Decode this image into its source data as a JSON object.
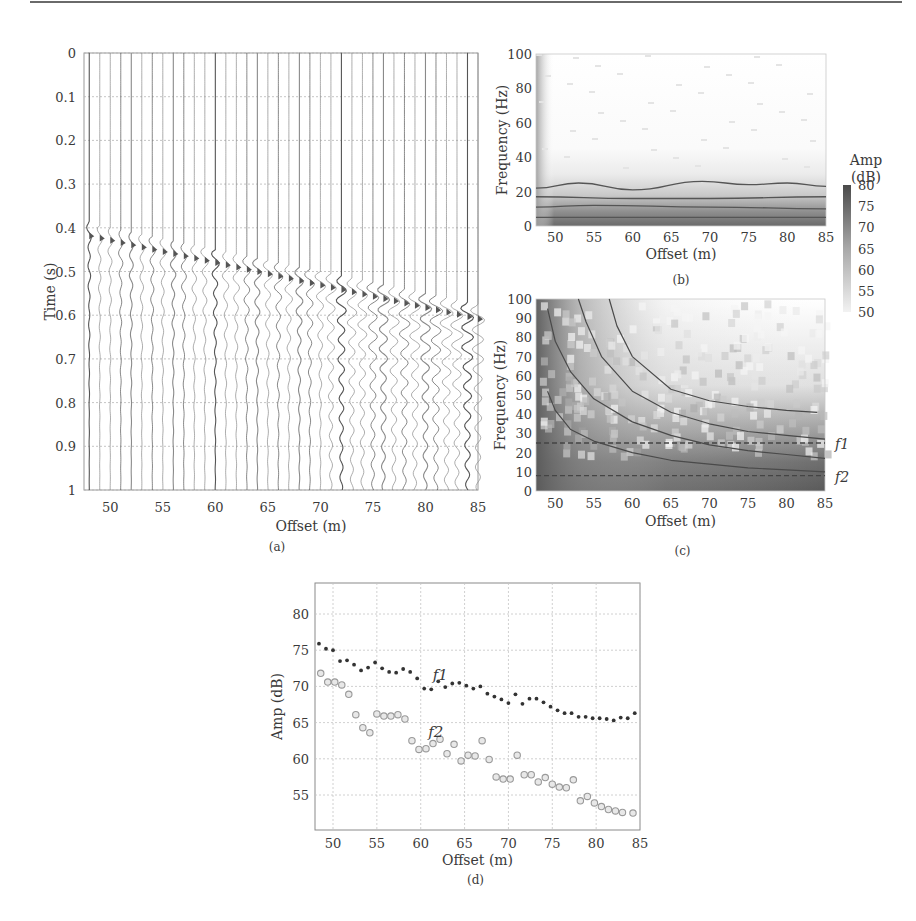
{
  "figure": {
    "panels": [
      "(a)",
      "(b)",
      "(c)",
      "(d)"
    ]
  },
  "chart_data": [
    {
      "id": "a",
      "type": "heatmap",
      "subtype": "seismic-wiggle-traces",
      "caption": "(a)",
      "xlabel": "Offset (m)",
      "ylabel": "Time (s)",
      "xlim": [
        47.5,
        85
      ],
      "ylim": [
        1,
        0
      ],
      "xticks": [
        50,
        55,
        60,
        65,
        70,
        75,
        80,
        85
      ],
      "yticks": [
        0,
        0.1,
        0.2,
        0.3,
        0.4,
        0.5,
        0.6,
        0.7,
        0.8,
        0.9,
        1
      ],
      "ytick_labels": [
        "0",
        "0.1",
        "0.2",
        "0.3",
        "0.4",
        "0.5",
        "0.6",
        "0.7",
        "0.8",
        "0.9",
        "1"
      ],
      "grid": true,
      "trace_count": 38,
      "first_arrival": {
        "offset_start": 48,
        "time_start": 0.41,
        "offset_end": 85,
        "time_end": 0.6
      }
    },
    {
      "id": "b",
      "type": "heatmap",
      "caption": "(b)",
      "xlabel": "Offset (m)",
      "ylabel": "Frequency (Hz)",
      "xlim": [
        47.5,
        85
      ],
      "ylim": [
        0,
        100
      ],
      "xticks": [
        50,
        55,
        60,
        65,
        70,
        75,
        80,
        85
      ],
      "yticks": [
        0,
        20,
        40,
        60,
        80,
        100
      ],
      "contours_hz": [
        {
          "x": [
            47.5,
            53,
            60,
            69,
            75,
            80,
            85
          ],
          "y": [
            22,
            25,
            21,
            26,
            24,
            25,
            23
          ]
        },
        {
          "x": [
            47.5,
            60,
            70,
            85
          ],
          "y": [
            17,
            16,
            16,
            17
          ]
        },
        {
          "x": [
            47.5,
            55,
            70,
            85
          ],
          "y": [
            11,
            12,
            11,
            10
          ]
        },
        {
          "x": [
            47.5,
            85
          ],
          "y": [
            5,
            5
          ]
        }
      ]
    },
    {
      "id": "colorbar",
      "type": "heatmap",
      "title": "Amp\n(dB)",
      "title_lines": [
        "Amp",
        "(dB)"
      ],
      "range": [
        50,
        80
      ],
      "ticks": [
        80,
        75,
        70,
        65,
        60,
        55,
        50
      ]
    },
    {
      "id": "c",
      "type": "heatmap",
      "caption": "(c)",
      "xlabel": "Offset (m)",
      "ylabel": "Frequency (Hz)",
      "xlim": [
        47.5,
        85
      ],
      "ylim": [
        0,
        100
      ],
      "xticks": [
        50,
        55,
        60,
        65,
        70,
        75,
        80,
        85
      ],
      "yticks": [
        0,
        10,
        20,
        30,
        40,
        50,
        60,
        70,
        80,
        90,
        100
      ],
      "annotations": [
        {
          "text": "f1",
          "freq": 25
        },
        {
          "text": "f2",
          "freq": 8
        }
      ],
      "dashed_lines_hz": [
        25,
        8
      ],
      "curves": [
        {
          "x": [
            49,
            50,
            52,
            55,
            60,
            65,
            70,
            75,
            80,
            85
          ],
          "y": [
            52,
            42,
            32,
            26,
            20,
            16,
            14,
            12,
            11,
            10
          ]
        },
        {
          "x": [
            49,
            50,
            52,
            55,
            60,
            65,
            70,
            75,
            80,
            85
          ],
          "y": [
            95,
            78,
            62,
            48,
            36,
            29,
            24,
            21,
            19,
            17
          ]
        },
        {
          "x": [
            53,
            54,
            56,
            60,
            65,
            70,
            75,
            80,
            85
          ],
          "y": [
            100,
            88,
            70,
            52,
            41,
            35,
            31,
            29,
            27
          ]
        },
        {
          "x": [
            57,
            58,
            60,
            65,
            70,
            75,
            80,
            84
          ],
          "y": [
            100,
            86,
            70,
            53,
            47,
            44,
            42,
            41
          ]
        }
      ]
    },
    {
      "id": "d",
      "type": "scatter",
      "caption": "(d)",
      "xlabel": "Offset (m)",
      "ylabel": "Amp (dB)",
      "xlim": [
        48,
        85
      ],
      "ylim": [
        50,
        84
      ],
      "xticks": [
        50,
        55,
        60,
        65,
        70,
        75,
        80,
        85
      ],
      "yticks": [
        55,
        60,
        65,
        70,
        75,
        80
      ],
      "grid": true,
      "series": [
        {
          "name": "f1",
          "marker": "filled-dot",
          "x": [
            48.4,
            49.2,
            50.0,
            50.8,
            51.6,
            52.4,
            53.2,
            54.0,
            54.8,
            55.6,
            56.4,
            57.2,
            58.0,
            58.8,
            59.6,
            60.4,
            61.2,
            62.0,
            62.8,
            63.6,
            64.4,
            65.2,
            66.0,
            66.8,
            67.6,
            68.4,
            69.2,
            70.0,
            70.8,
            71.6,
            72.4,
            73.2,
            74.0,
            74.8,
            75.6,
            76.4,
            77.2,
            78.0,
            78.8,
            79.6,
            80.4,
            81.2,
            82.0,
            82.8,
            83.6,
            84.4
          ],
          "y": [
            75.9,
            75.2,
            75.0,
            73.5,
            73.6,
            73.0,
            72.2,
            72.6,
            73.3,
            72.5,
            72.0,
            71.9,
            72.4,
            72.0,
            71.1,
            69.7,
            69.6,
            70.7,
            69.9,
            70.4,
            70.5,
            70.1,
            69.7,
            70.0,
            69.0,
            68.6,
            68.2,
            67.7,
            68.9,
            67.6,
            68.3,
            68.3,
            67.8,
            67.2,
            66.7,
            66.3,
            66.3,
            65.8,
            65.8,
            65.6,
            65.6,
            65.5,
            65.3,
            65.7,
            65.6,
            66.3
          ]
        },
        {
          "name": "f2",
          "marker": "open-circle",
          "x": [
            48.6,
            49.4,
            50.2,
            51.0,
            51.8,
            52.6,
            53.4,
            54.2,
            55.0,
            55.8,
            56.6,
            57.4,
            58.2,
            59.0,
            59.8,
            60.6,
            61.4,
            62.2,
            63.0,
            63.8,
            64.6,
            65.4,
            66.2,
            67.0,
            67.8,
            68.6,
            69.4,
            70.2,
            71.0,
            71.8,
            72.6,
            73.4,
            74.2,
            75.0,
            75.8,
            76.6,
            77.4,
            78.2,
            79.0,
            79.8,
            80.6,
            81.4,
            82.2,
            83.0,
            84.2
          ],
          "y": [
            71.8,
            70.6,
            70.6,
            70.2,
            68.9,
            66.1,
            64.3,
            63.6,
            66.2,
            65.9,
            65.9,
            66.1,
            65.5,
            62.5,
            61.3,
            61.4,
            62.1,
            62.7,
            60.7,
            62.0,
            59.7,
            60.5,
            60.4,
            62.5,
            59.9,
            57.5,
            57.2,
            57.2,
            60.5,
            57.8,
            57.8,
            56.8,
            57.4,
            56.5,
            56.1,
            56.0,
            57.1,
            54.2,
            54.8,
            53.9,
            53.4,
            53.0,
            52.8,
            52.6,
            52.5
          ]
        }
      ],
      "annotations": [
        {
          "text": "f1",
          "x": 62,
          "y": 71.5
        },
        {
          "text": "f2",
          "x": 61.5,
          "y": 63.5
        }
      ]
    }
  ]
}
